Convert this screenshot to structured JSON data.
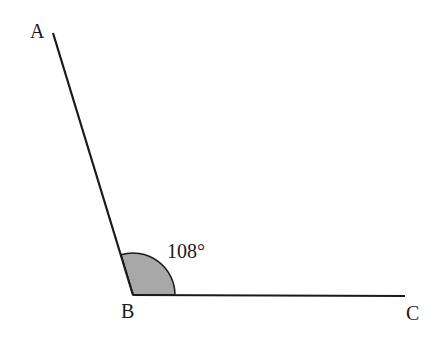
{
  "diagram": {
    "points": {
      "A": {
        "label": "A",
        "x": 53,
        "y": 33
      },
      "B": {
        "label": "B",
        "x": 133,
        "y": 295
      },
      "C": {
        "label": "C",
        "x": 405,
        "y": 296
      }
    },
    "angle": {
      "vertex": "B",
      "value": "108°",
      "fill": "#a8a8a8"
    },
    "colors": {
      "line": "#1a1a1a",
      "background": "#ffffff"
    }
  }
}
